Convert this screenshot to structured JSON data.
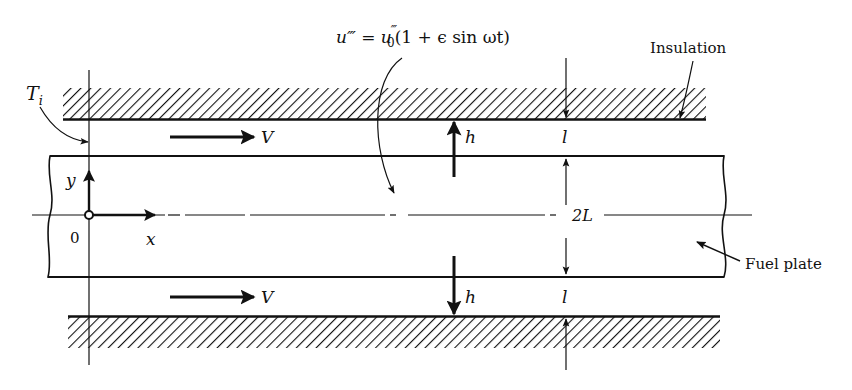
{
  "figure": {
    "equation": {
      "lhs": "u‴",
      "eq": " = ",
      "rhs_base": "u",
      "rhs_sup": "‴",
      "rhs_sub": "0",
      "rhs_rest": "(1 + ϵ sin ωt)"
    },
    "labels": {
      "inlet_temperature": "T",
      "inlet_temperature_sub": "i",
      "insulation": "Insulation",
      "fuel_plate": "Fuel plate",
      "velocity_top": "V",
      "velocity_bottom": "V",
      "heat_coeff_top": "h",
      "heat_coeff_bottom": "h",
      "gap_top": "l",
      "gap_bottom": "l",
      "thickness": "2L",
      "axis_x": "x",
      "axis_y": "y",
      "origin": "0"
    },
    "colors": {
      "ink": "#111111",
      "background": "#ffffff"
    }
  }
}
